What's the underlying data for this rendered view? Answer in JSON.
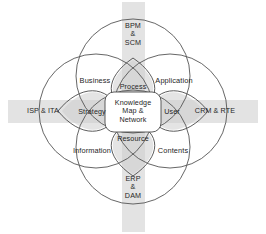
{
  "diagram": {
    "colors": {
      "background": "#ffffff",
      "band": "#e3e3e3",
      "circle_stroke": "#555555",
      "inner_stroke": "#4a4a4a",
      "lens_fill": "#d2d2d2",
      "core_fill": "#ffffff",
      "text": "#262626"
    },
    "outer_labels": [
      {
        "key": "top",
        "text": "BPM\n&\nSCM"
      },
      {
        "key": "right",
        "text": "CRM & RTE"
      },
      {
        "key": "bottom",
        "text": "ERP\n&\nDAM"
      },
      {
        "key": "left",
        "text": "ISP & ITA"
      }
    ],
    "quadrant_labels": [
      {
        "key": "top-left",
        "text": "Business"
      },
      {
        "key": "top-right",
        "text": "Application"
      },
      {
        "key": "bottom-left",
        "text": "Information"
      },
      {
        "key": "bottom-right",
        "text": "Contents"
      }
    ],
    "inner_labels": [
      {
        "key": "top",
        "text": "Process"
      },
      {
        "key": "right",
        "text": "User"
      },
      {
        "key": "bottom",
        "text": "Resource"
      },
      {
        "key": "left",
        "text": "Strategy"
      }
    ],
    "core_label": {
      "key": "center",
      "text": "Knowledge\nMap &\nNetwork"
    }
  }
}
